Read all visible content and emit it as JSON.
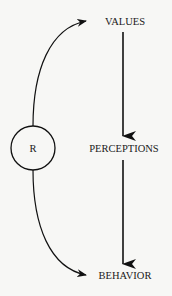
{
  "diagram": {
    "nodes": {
      "values": "VALUES",
      "perceptions": "PERCEPTIONS",
      "behavior": "BEHAVIOR",
      "r": "R"
    },
    "edges": [
      {
        "from": "VALUES",
        "to": "PERCEPTIONS",
        "style": "straight-bold"
      },
      {
        "from": "PERCEPTIONS",
        "to": "BEHAVIOR",
        "style": "straight-bold"
      },
      {
        "from": "R",
        "to": "VALUES",
        "style": "curved"
      },
      {
        "from": "R",
        "to": "BEHAVIOR",
        "style": "curved"
      }
    ],
    "colors": {
      "background": "#f7f7f5",
      "ink": "#111111"
    }
  }
}
